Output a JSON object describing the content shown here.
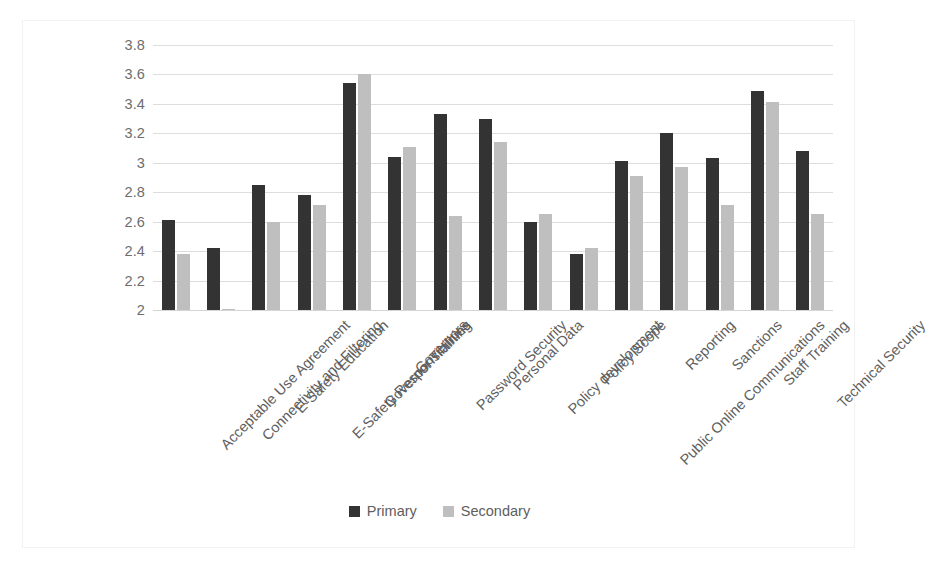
{
  "chart_data": {
    "type": "bar",
    "title": "",
    "subtitle": "",
    "xlabel": "",
    "ylabel": "",
    "ylim": [
      2,
      3.8
    ],
    "ytick_labels": [
      "3.8",
      "3.6",
      "3.4",
      "3.2",
      "3",
      "2.8",
      "2.6",
      "2.4",
      "2.2",
      "2"
    ],
    "ytick_values": [
      3.8,
      3.6,
      3.4,
      3.2,
      3.0,
      2.8,
      2.6,
      2.4,
      2.2,
      2.0
    ],
    "grid": true,
    "legend_position": "bottom-center",
    "categories": [
      "Acceptable Use Agreement",
      "Connectivity and Filtering",
      "E-Safety Education",
      "E-Safety Responsibilities",
      "Governor Training",
      "Governors",
      "Password Security",
      "Personal Data",
      "Policy development",
      "Policy Scope",
      "Public Online Communications",
      "Reporting",
      "Sanctions",
      "Staff Training",
      "Technical Security"
    ],
    "series": [
      {
        "name": "Primary",
        "color": "#333333",
        "values": [
          2.61,
          2.42,
          2.85,
          2.78,
          3.54,
          3.04,
          3.33,
          3.3,
          2.6,
          2.38,
          3.01,
          3.2,
          3.03,
          3.49,
          3.08
        ]
      },
      {
        "name": "Secondary",
        "color": "#bfbfbf",
        "values": [
          2.38,
          2.01,
          2.6,
          2.71,
          3.6,
          3.11,
          2.64,
          3.14,
          2.65,
          2.42,
          2.91,
          2.97,
          2.71,
          3.41,
          2.65
        ]
      }
    ]
  },
  "legend": {
    "items": [
      {
        "label": "Primary",
        "color": "#333333"
      },
      {
        "label": "Secondary",
        "color": "#bfbfbf"
      }
    ]
  },
  "colors": {
    "primary_series": "#333333",
    "secondary_series": "#bfbfbf",
    "gridline": "#dddddd",
    "axis_text": "#5e5e5e",
    "frame_border": "#f2f2f2",
    "background": "#ffffff"
  }
}
